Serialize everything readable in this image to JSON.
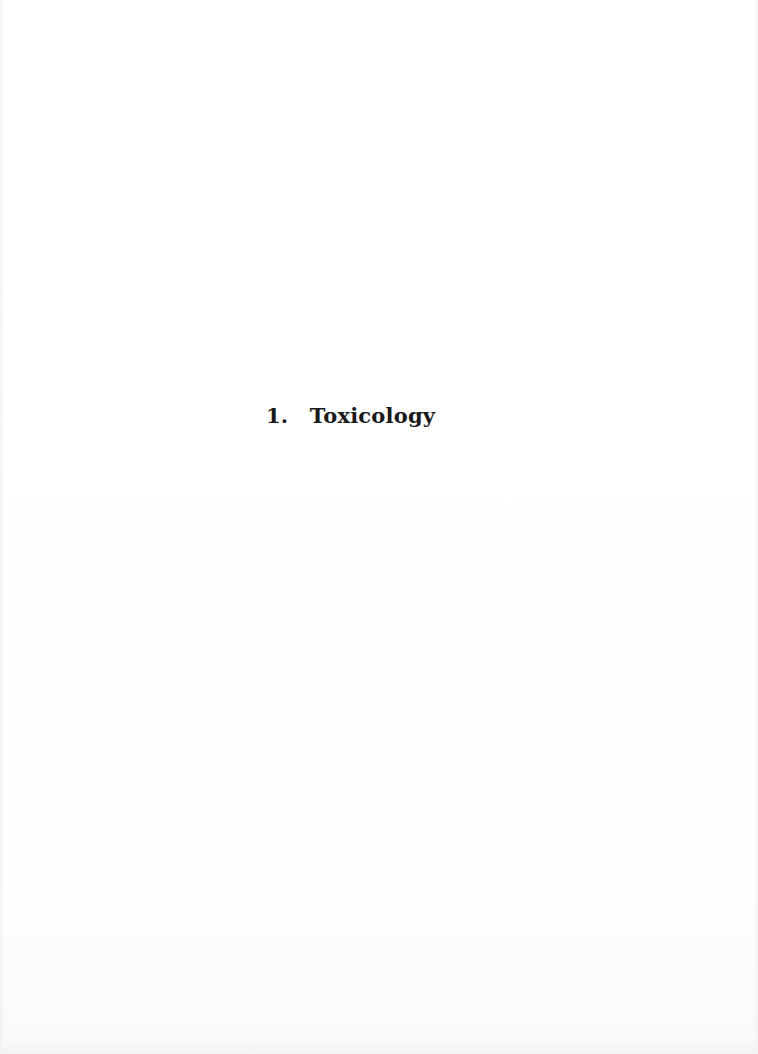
{
  "document": {
    "section": {
      "number": "1.",
      "title": "Toxicology"
    }
  }
}
